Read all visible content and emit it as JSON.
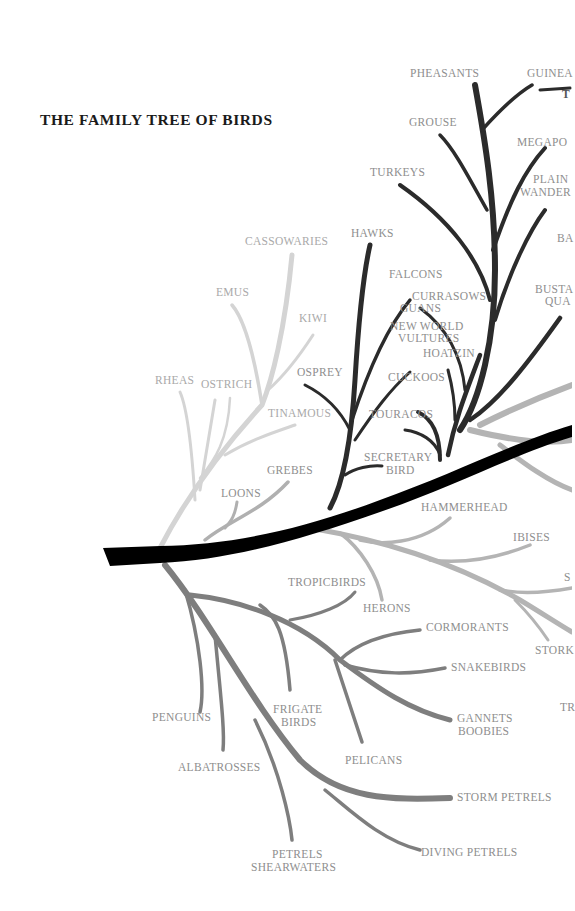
{
  "title": "THE FAMILY TREE OF BIRDS",
  "colors": {
    "trunk": "#000000",
    "ratites_branch": "#d2d2d2",
    "landbird_branch": "#2c2c2c",
    "waterbird_branch": "#7e7e7e",
    "wader_branch": "#b4b4b4",
    "label_text": "#8e8e8e",
    "title_text": "#1a1a1a"
  },
  "labels": {
    "pheasants": "PHEASANTS",
    "guinea_partial": "GUINEA",
    "t_partial": "T",
    "grouse": "GROUSE",
    "megapodes_partial": "MEGAPO",
    "plains_wanderer_1": "PLAIN",
    "plains_wanderer_2": "WANDER",
    "turkeys": "TURKEYS",
    "ba_partial": "BA",
    "hawks": "HAWKS",
    "cassowaries": "CASSOWARIES",
    "falcons": "FALCONS",
    "emus": "EMUS",
    "currasows": "CURRASOWS",
    "guans": "GUANS",
    "bustards_1": "BUSTA",
    "bustards_2": "QUA",
    "kiwi": "KIWI",
    "new_world_vultures_1": "NEW WORLD",
    "new_world_vultures_2": "VULTURES",
    "hoatzin": "HOATZIN",
    "rheas": "RHEAS",
    "ostrich": "OSTRICH",
    "osprey": "OSPREY",
    "cuckoos": "CUCKOOS",
    "tinamous": "TINAMOUS",
    "touracos": "TOURACOS",
    "secretary_bird_1": "SECRETARY",
    "secretary_bird_2": "BIRD",
    "grebes": "GREBES",
    "loons": "LOONS",
    "hammerhead": "HAMMERHEAD",
    "ibises": "IBISES",
    "s_partial": "S",
    "tropicbirds": "TROPICBIRDS",
    "herons": "HERONS",
    "cormorants": "CORMORANTS",
    "storks_partial": "STORK",
    "snakebirds": "SNAKEBIRDS",
    "penguins": "PENGUINS",
    "frigate_birds_1": "FRIGATE",
    "frigate_birds_2": "BIRDS",
    "gannets_boobies_1": "GANNETS",
    "gannets_boobies_2": "BOOBIES",
    "tr_partial": "TR",
    "pelicans": "PELICANS",
    "albatrosses": "ALBATROSSES",
    "storm_petrels": "STORM PETRELS",
    "petrels_shearwaters_1": "PETRELS",
    "petrels_shearwaters_2": "SHEARWATERS",
    "diving_petrels": "DIVING PETRELS"
  }
}
